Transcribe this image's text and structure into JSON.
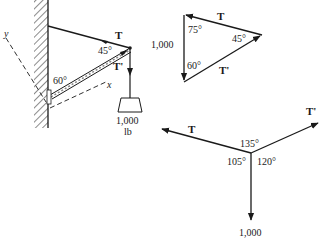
{
  "colors": {
    "ink": "#1a1a1a",
    "background": "#ffffff"
  },
  "structure_diagram": {
    "tension_label": "T",
    "strut_force_label": "T'",
    "angle_top": "45°",
    "angle_wall": "60°",
    "axis_x_label": "x",
    "axis_y_label": "y",
    "load_value": "1,000",
    "load_unit": "lb"
  },
  "force_triangle": {
    "side_top_label": "T",
    "side_bottom_label": "T'",
    "side_left_label": "1,000",
    "angle_top_left": "75°",
    "angle_right": "45°",
    "angle_bottom_left": "60°"
  },
  "force_diagram": {
    "tension_label": "T",
    "strut_force_label": "T'",
    "angle_between_T_T1": "135°",
    "angle_T_down": "105°",
    "angle_T1_down": "120°",
    "load_value": "1,000"
  }
}
